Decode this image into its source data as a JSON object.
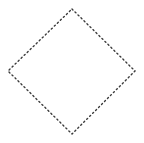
{
  "canvas": {
    "width": 144,
    "height": 143,
    "background_color": "#ffffff",
    "title": ""
  },
  "shape": {
    "name": "dotted-diamond-outline",
    "type": "polygon",
    "sides": 4,
    "description": "Diamond (square rotated 45 degrees) drawn as a dotted outline",
    "fill": "none",
    "stroke_color": "#3a3a3a",
    "stroke_width": 1.4,
    "line_style": "dotted",
    "dot_size": 1.3,
    "dot_gap": 2.9,
    "vertices": [
      {
        "name": "top",
        "x": 72,
        "y": 9
      },
      {
        "name": "right",
        "x": 135,
        "y": 71
      },
      {
        "name": "bottom",
        "x": 72,
        "y": 134
      },
      {
        "name": "left",
        "x": 8,
        "y": 71
      }
    ],
    "points_attr": "72,9 135,71 72,134 8,71",
    "center": {
      "x": 71.5,
      "y": 71.5
    },
    "diagonal_horizontal": 127,
    "diagonal_vertical": 125
  }
}
